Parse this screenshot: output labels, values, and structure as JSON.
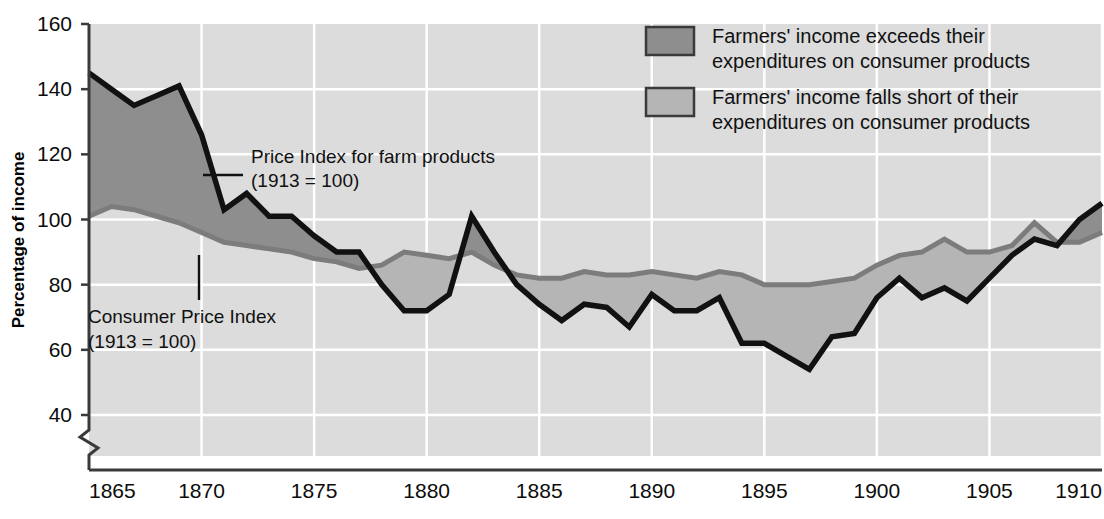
{
  "chart_data": {
    "type": "area",
    "title": "",
    "xlabel": "",
    "ylabel": "Percentage of income",
    "xlim": [
      1865,
      1910
    ],
    "ylim": [
      36,
      160
    ],
    "y_axis_break": true,
    "grid": true,
    "y_ticks": [
      40,
      60,
      80,
      100,
      120,
      140,
      160
    ],
    "x_ticks": [
      1865,
      1870,
      1875,
      1880,
      1885,
      1890,
      1895,
      1900,
      1905,
      1910
    ],
    "x": [
      1865,
      1866,
      1867,
      1868,
      1869,
      1870,
      1871,
      1872,
      1873,
      1874,
      1875,
      1876,
      1877,
      1878,
      1879,
      1880,
      1881,
      1882,
      1883,
      1884,
      1885,
      1886,
      1887,
      1888,
      1889,
      1890,
      1891,
      1892,
      1893,
      1894,
      1895,
      1896,
      1897,
      1898,
      1899,
      1900,
      1901,
      1902,
      1903,
      1904,
      1905,
      1906,
      1907,
      1908,
      1909,
      1910
    ],
    "series": [
      {
        "name": "Price Index for farm products (1913 = 100)",
        "color": "#111111",
        "values": [
          145,
          140,
          135,
          138,
          141,
          126,
          103,
          108,
          101,
          101,
          95,
          90,
          90,
          80,
          72,
          72,
          77,
          101,
          90,
          80,
          74,
          69,
          74,
          73,
          67,
          77,
          72,
          72,
          76,
          62,
          62,
          58,
          54,
          64,
          65,
          76,
          82,
          76,
          79,
          75,
          82,
          89,
          94,
          92,
          100,
          105
        ]
      },
      {
        "name": "Consumer Price Index (1913 = 100)",
        "color": "#7c7c7c",
        "values": [
          101,
          104,
          103,
          101,
          99,
          96,
          93,
          92,
          91,
          90,
          88,
          87,
          85,
          86,
          90,
          89,
          88,
          90,
          86,
          83,
          82,
          82,
          84,
          83,
          83,
          84,
          83,
          82,
          84,
          83,
          80,
          80,
          80,
          81,
          82,
          86,
          89,
          90,
          94,
          90,
          90,
          92,
          99,
          93,
          93,
          96
        ]
      }
    ],
    "fill_above": {
      "label": "Farmers' income exceeds their expenditures on consumer products",
      "color": "#8e8e8e"
    },
    "fill_below": {
      "label": "Farmers' income falls short of their expenditures on consumer products",
      "color": "#b5b5b5"
    },
    "plot_background": "#dcdcdc",
    "gridline_color": "#ffffff"
  },
  "annotations": [
    {
      "id": "farm-price-annotation",
      "line1": "Price Index for farm products",
      "line2": "(1913 = 100)"
    },
    {
      "id": "consumer-price-annotation",
      "line1": "Consumer Price Index",
      "line2": "(1913 = 100)"
    }
  ],
  "legend": {
    "position": "top-right",
    "items": [
      {
        "swatch_color": "#8e8e8e",
        "line1": "Farmers' income exceeds their",
        "line2": "expenditures on consumer products"
      },
      {
        "swatch_color": "#b5b5b5",
        "line1": "Farmers' income falls short of their",
        "line2": "expenditures on consumer products"
      }
    ]
  },
  "axis": {
    "y_title": "Percentage of income",
    "y_tick_labels": [
      "160",
      "140",
      "120",
      "100",
      "80",
      "60",
      "40"
    ],
    "x_tick_labels": [
      "1865",
      "1870",
      "1875",
      "1880",
      "1885",
      "1890",
      "1895",
      "1900",
      "1905",
      "1910"
    ]
  }
}
